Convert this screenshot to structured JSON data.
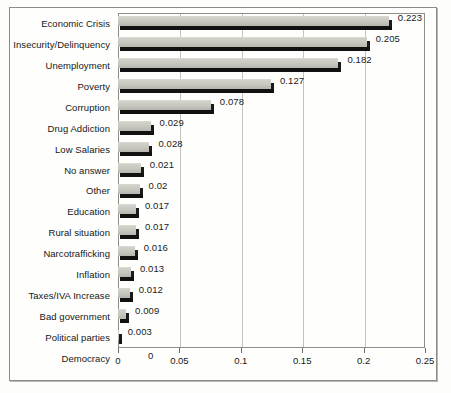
{
  "chart_data": {
    "type": "bar",
    "orientation": "horizontal",
    "title": "",
    "subtitle": "",
    "xlabel": "",
    "ylabel": "",
    "xlim": [
      0,
      0.25
    ],
    "xticks": [
      "0",
      "0.05",
      "0.1",
      "0.15",
      "0.2",
      "0.25"
    ],
    "xtick_values": [
      0,
      0.05,
      0.1,
      0.15,
      0.2,
      0.25
    ],
    "grid": "vertical",
    "legend": "none",
    "bar_color": "#c6c6be",
    "shadow_color": "#111111",
    "categories": [
      "Economic Crisis",
      "Insecurity/Delinquency",
      "Unemployment",
      "Poverty",
      "Corruption",
      "Drug Addiction",
      "Low Salaries",
      "No answer",
      "Other",
      "Education",
      "Rural situation",
      "Narcotrafficking",
      "Inflation",
      "Taxes/IVA Increase",
      "Bad government",
      "Political parties",
      "Democracy"
    ],
    "values": [
      0.223,
      0.205,
      0.182,
      0.127,
      0.078,
      0.029,
      0.028,
      0.021,
      0.02,
      0.017,
      0.017,
      0.016,
      0.013,
      0.012,
      0.009,
      0.003,
      0
    ],
    "data_labels": [
      "0.223",
      "0.205",
      "0.182",
      "0.127",
      "0.078",
      "0.029",
      "0.028",
      "0.021",
      "0.02",
      "0.017",
      "0.017",
      "0.016",
      "0.013",
      "0.012",
      "0.009",
      "0.003",
      "0"
    ]
  }
}
